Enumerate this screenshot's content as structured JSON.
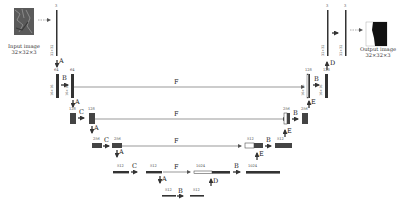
{
  "input": {
    "title": "Input image",
    "shape": "32×32×3"
  },
  "output": {
    "title": "Output image",
    "shape": "32×32×3"
  },
  "ops": {
    "A": "A",
    "B": "B",
    "C": "C",
    "D": "D",
    "E": "E",
    "F": "F"
  },
  "channels": {
    "c3": "3",
    "c64": "64",
    "c128": "128",
    "c256": "256",
    "c512": "512",
    "c1024": "1024"
  },
  "sizes": {
    "s32": "32×32",
    "s16": "16×16",
    "s8": "8×8",
    "s4": "4×4",
    "s2": "2×2"
  },
  "colors": {
    "stroke": "#333333",
    "block_dark": "#444444",
    "block_light": "#ffffff",
    "line": "#555555"
  }
}
